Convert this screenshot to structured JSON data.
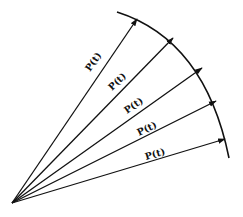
{
  "diagram": {
    "stroke_color": "#111111",
    "background": "#ffffff",
    "origin": [
      12,
      203
    ],
    "arc": {
      "start": [
        117,
        12
      ],
      "end": [
        229,
        158
      ]
    },
    "vectors": [
      {
        "label": "P(t)",
        "subscript_legible": false,
        "tip": [
          137,
          19
        ],
        "label_pos": [
          90,
          72
        ],
        "angle": -55
      },
      {
        "label": "P(t)",
        "subscript_legible": false,
        "tip": [
          173,
          38
        ],
        "label_pos": [
          112,
          89
        ],
        "angle": -44
      },
      {
        "label": "P(t)",
        "subscript_legible": false,
        "tip": [
          202,
          68
        ],
        "label_pos": [
          133,
          108
        ],
        "angle": -35
      },
      {
        "label": "P(t)",
        "subscript_legible": false,
        "tip": [
          216,
          101
        ],
        "label_pos": [
          145,
          128
        ],
        "angle": -26
      },
      {
        "label": "P(t)",
        "subscript_legible": false,
        "tip": [
          225,
          139
        ],
        "label_pos": [
          154,
          151
        ],
        "angle": -16
      }
    ]
  }
}
